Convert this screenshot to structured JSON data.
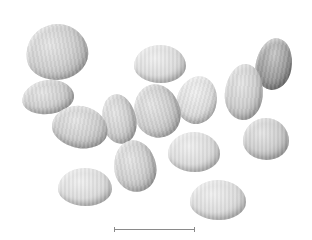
{
  "image": {
    "subject": "seeds",
    "seed_count": 14,
    "background_color": "#ffffff",
    "scale_bar": {
      "label": ""
    }
  }
}
